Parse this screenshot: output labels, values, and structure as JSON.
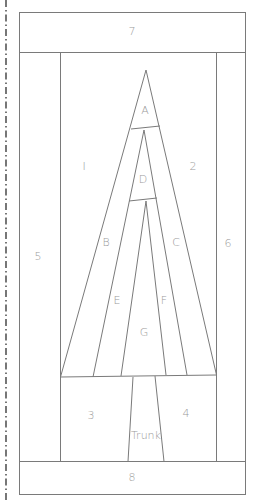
{
  "diagram": {
    "type": "foundation paper piecing pattern",
    "line_color": "#7a7a7a",
    "label_color": "#9a9a9a",
    "labels": {
      "top_border": "7",
      "bottom_border": "8",
      "left_side": "5",
      "right_side": "6",
      "left_background": "I",
      "right_background": "2",
      "bottom_left": "3",
      "bottom_right": "4",
      "trunk": "Trunk",
      "piece_a": "A",
      "piece_b": "B",
      "piece_c": "C",
      "piece_d": "D",
      "piece_e": "E",
      "piece_f": "F",
      "piece_g": "G"
    }
  }
}
